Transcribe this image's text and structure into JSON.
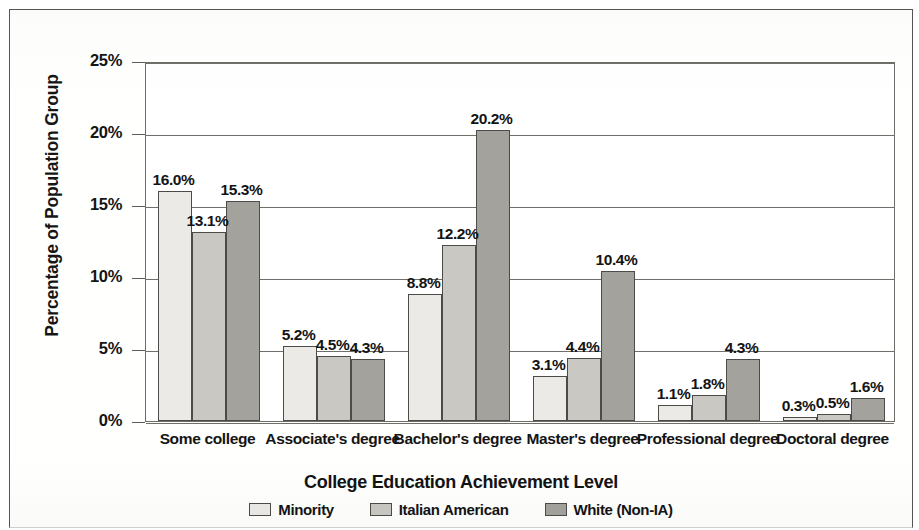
{
  "chart_data": {
    "type": "bar",
    "title": "",
    "xlabel": "College Education Achievement Level",
    "ylabel": "Percentage of Population Group",
    "categories": [
      "Some college",
      "Associate's degree",
      "Bachelor's degree",
      "Master's degree",
      "Professional degree",
      "Doctoral degree"
    ],
    "series": [
      {
        "name": "Minority",
        "color": "#ebeae6",
        "values": [
          16.0,
          5.2,
          8.8,
          3.1,
          1.1,
          0.3
        ]
      },
      {
        "name": "Italian American",
        "color": "#c9c8c2",
        "values": [
          13.1,
          4.5,
          12.2,
          4.4,
          1.8,
          0.5
        ]
      },
      {
        "name": "White (Non-IA)",
        "color": "#a3a29c",
        "values": [
          15.3,
          4.3,
          20.2,
          10.4,
          4.3,
          1.6
        ]
      }
    ],
    "value_labels": [
      [
        "16.0%",
        "13.1%",
        "15.3%"
      ],
      [
        "5.2%",
        "4.5%",
        "4.3%"
      ],
      [
        "8.8%",
        "12.2%",
        "20.2%"
      ],
      [
        "3.1%",
        "4.4%",
        "10.4%"
      ],
      [
        "1.1%",
        "1.8%",
        "4.3%"
      ],
      [
        "0.3%",
        "0.5%",
        "1.6%"
      ]
    ],
    "ylim": [
      0,
      25
    ],
    "ytick_values": [
      0,
      5,
      10,
      15,
      20,
      25
    ],
    "ytick_labels": [
      "0%",
      "5%",
      "10%",
      "15%",
      "20%",
      "25%"
    ],
    "grid": "horizontal",
    "legend_position": "bottom",
    "bar_value_format": "percent-one-decimal"
  },
  "legend": {
    "items": [
      {
        "label": "Minority",
        "swatch": "#ebeae6"
      },
      {
        "label": "Italian American",
        "swatch": "#c9c8c2"
      },
      {
        "label": "White (Non-IA)",
        "swatch": "#a3a29c"
      }
    ]
  }
}
